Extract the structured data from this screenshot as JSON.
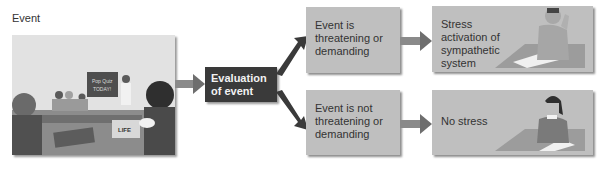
{
  "diagram": {
    "event_label": "Event",
    "photo": {
      "description": "classroom illustration with students",
      "chalkboard_text": "Pop Quiz TODAY!",
      "magazine_text": "LIFE"
    },
    "evaluation_box": {
      "label": "Evaluation of event"
    },
    "branches": [
      {
        "condition": "Event is threatening or demanding",
        "outcome": "Stress activation of sympathetic system",
        "illustration": "stressed student holding head at desk"
      },
      {
        "condition": "Event is not threatening or demanding",
        "outcome": "No stress",
        "illustration": "relaxed student resting chin on hand at desk"
      }
    ],
    "colors": {
      "evaluation_box": "#3a3a3a",
      "gray_box": "#bfbfbf",
      "arrow": "#6e6e6e",
      "text": "#333333"
    }
  }
}
